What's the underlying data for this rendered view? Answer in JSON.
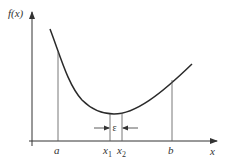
{
  "diagram": {
    "type": "function-minimum-search",
    "y_axis_label": "f(x)",
    "x_axis_label": "x",
    "points": {
      "a": "a",
      "b": "b",
      "x1": "x",
      "x1_sub": "1",
      "x2": "x",
      "x2_sub": "2"
    },
    "epsilon_label": "ε",
    "colors": {
      "axis": "#333333",
      "curve": "#2a2a2a",
      "guide": "#555555"
    }
  }
}
